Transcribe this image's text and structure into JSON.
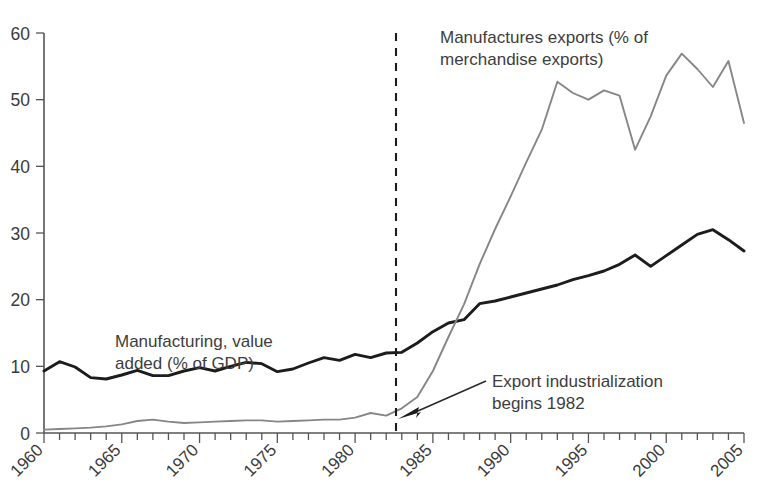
{
  "chart_data": {
    "type": "line",
    "title": "",
    "subtitle": "",
    "xlabel": "",
    "ylabel": "",
    "xlim": [
      1960,
      2005
    ],
    "ylim": [
      0,
      60
    ],
    "grid": false,
    "legend_position": "inline-annotations",
    "y_ticks": [
      0,
      10,
      20,
      30,
      40,
      50,
      60
    ],
    "y_tick_labels": [
      "0",
      "10",
      "20",
      "30",
      "40",
      "50",
      "60"
    ],
    "x_ticks": [
      1960,
      1965,
      1970,
      1975,
      1980,
      1985,
      1990,
      1995,
      2000,
      2005
    ],
    "x_tick_labels": [
      "1960",
      "1965",
      "1970",
      "1975",
      "1980",
      "1985",
      "1990",
      "1995",
      "2000",
      "2005"
    ],
    "x_minor_tick_interval": 1,
    "x": [
      1960,
      1961,
      1962,
      1963,
      1964,
      1965,
      1966,
      1967,
      1968,
      1969,
      1970,
      1971,
      1972,
      1973,
      1974,
      1975,
      1976,
      1977,
      1978,
      1979,
      1980,
      1981,
      1982,
      1983,
      1984,
      1985,
      1986,
      1987,
      1988,
      1989,
      1990,
      1991,
      1992,
      1993,
      1994,
      1995,
      1996,
      1997,
      1998,
      1999,
      2000,
      2001,
      2002,
      2003,
      2004,
      2005
    ],
    "series": [
      {
        "name": "Manufacturing, value added (% of GDP)",
        "color": "#1c1c1c",
        "values": [
          9.3,
          10.7,
          9.9,
          8.3,
          8.1,
          8.7,
          9.4,
          8.6,
          8.6,
          9.3,
          9.8,
          9.3,
          10.0,
          10.6,
          10.4,
          9.2,
          9.6,
          10.5,
          11.3,
          10.9,
          11.8,
          11.3,
          12.0,
          12.1,
          13.5,
          15.2,
          16.5,
          17.0,
          19.4,
          19.8,
          20.4,
          21.0,
          21.6,
          22.2,
          23.0,
          23.6,
          24.3,
          25.3,
          26.7,
          25.0,
          26.6,
          28.2,
          29.8,
          30.5,
          29.0,
          27.3
        ]
      },
      {
        "name": "Manufactures exports (% of merchandise exports)",
        "color": "#868686",
        "values": [
          0.5,
          0.6,
          0.7,
          0.8,
          1.0,
          1.3,
          1.8,
          2.0,
          1.7,
          1.5,
          1.6,
          1.7,
          1.8,
          1.9,
          1.9,
          1.7,
          1.8,
          1.9,
          2.0,
          2.0,
          2.3,
          3.0,
          2.6,
          3.7,
          5.4,
          9.3,
          14.4,
          19.3,
          25.3,
          30.6,
          35.5,
          40.6,
          45.5,
          52.7,
          51.0,
          50.0,
          51.4,
          50.6,
          42.5,
          47.5,
          53.6,
          56.9,
          54.6,
          51.9,
          55.8,
          46.5
        ]
      }
    ],
    "annotations": [
      {
        "id": "manufacturing-label",
        "text_lines": [
          "Manufacturing, value",
          "added (% of GDP)"
        ],
        "x_px": 115,
        "y_px": 330
      },
      {
        "id": "exports-label",
        "text_lines": [
          "Manufactures exports (% of",
          "merchandise exports)"
        ],
        "x_px": 440,
        "y_px": 26
      },
      {
        "id": "event-label",
        "text_lines": [
          "Export industrialization",
          "begins 1982"
        ],
        "x_px": 492,
        "y_px": 370
      }
    ],
    "event_marker": {
      "label": "Export industrialization begins 1982",
      "year": 1982,
      "style": "dashed-vertical-line"
    }
  }
}
